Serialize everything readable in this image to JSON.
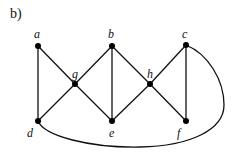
{
  "figure": {
    "label": "b)"
  },
  "graph": {
    "nodes": [
      {
        "id": "a",
        "label": "a",
        "x": 38,
        "y": 46
      },
      {
        "id": "b",
        "label": "b",
        "x": 112,
        "y": 46
      },
      {
        "id": "c",
        "label": "c",
        "x": 186,
        "y": 45
      },
      {
        "id": "g",
        "label": "g",
        "x": 75,
        "y": 84
      },
      {
        "id": "h",
        "label": "h",
        "x": 150,
        "y": 84
      },
      {
        "id": "d",
        "label": "d",
        "x": 38,
        "y": 121
      },
      {
        "id": "e",
        "label": "e",
        "x": 112,
        "y": 121
      },
      {
        "id": "f",
        "label": "f",
        "x": 186,
        "y": 121
      }
    ],
    "edges": [
      [
        "a",
        "d"
      ],
      [
        "a",
        "g"
      ],
      [
        "g",
        "b"
      ],
      [
        "g",
        "d"
      ],
      [
        "g",
        "e"
      ],
      [
        "b",
        "e"
      ],
      [
        "b",
        "h"
      ],
      [
        "h",
        "e"
      ],
      [
        "h",
        "c"
      ],
      [
        "h",
        "f"
      ],
      [
        "c",
        "f"
      ],
      [
        "d",
        "c"
      ]
    ],
    "curved_edge": [
      "d",
      "c"
    ]
  }
}
